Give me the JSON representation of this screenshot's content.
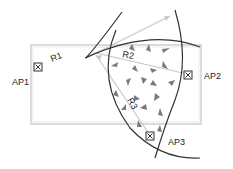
{
  "diagram": {
    "access_points": [
      {
        "id": "AP1",
        "label": "AP1",
        "x": 38,
        "y": 67,
        "label_x": 12,
        "label_y": 85
      },
      {
        "id": "AP2",
        "label": "AP2",
        "x": 188,
        "y": 75,
        "label_x": 204,
        "label_y": 79
      },
      {
        "id": "AP3",
        "label": "AP3",
        "x": 150,
        "y": 136,
        "label_x": 168,
        "label_y": 145
      }
    ],
    "ranges": [
      {
        "id": "R1",
        "label": "R1",
        "x": 52,
        "y": 60,
        "rotate": -22
      },
      {
        "id": "R2",
        "label": "R2",
        "x": 124,
        "y": 56,
        "rotate": 10
      },
      {
        "id": "R3",
        "label": "R3",
        "x": 127,
        "y": 104,
        "rotate": 60
      }
    ],
    "colors": {
      "arc": "#333333",
      "ray": "#c8c8c8",
      "room": "#d0d0d0",
      "arrow": "#7a7a7a"
    }
  }
}
